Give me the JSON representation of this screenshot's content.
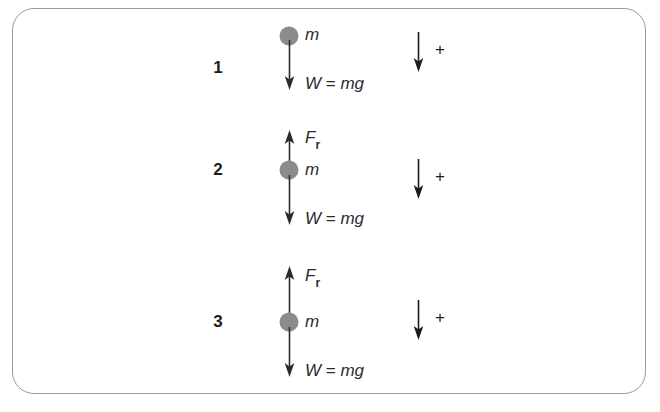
{
  "figure": {
    "type": "physics-free-body-diagram",
    "background_color": "#ffffff",
    "border_color": "#9a9a9a",
    "dot_color": "#8c8c8c",
    "arrow_color": "#2b2b2b",
    "groups": [
      {
        "number": "1",
        "mass_label": "m",
        "weight_label": "W = mg",
        "weight_label_parts": {
          "lhs": "W",
          "eq": " = ",
          "rhs": "mg"
        },
        "has_resistance_force": false,
        "resistance_label": "",
        "resistance_label_parts": {
          "base": "",
          "sub": ""
        },
        "reference_plus_label": "+",
        "reference_arrow_direction": "down"
      },
      {
        "number": "2",
        "mass_label": "m",
        "weight_label": "W = mg",
        "weight_label_parts": {
          "lhs": "W",
          "eq": " = ",
          "rhs": "mg"
        },
        "has_resistance_force": true,
        "resistance_label": "Fr",
        "resistance_label_parts": {
          "base": "F",
          "sub": "r"
        },
        "reference_plus_label": "+",
        "reference_arrow_direction": "down"
      },
      {
        "number": "3",
        "mass_label": "m",
        "weight_label": "W = mg",
        "weight_label_parts": {
          "lhs": "W",
          "eq": " = ",
          "rhs": "mg"
        },
        "has_resistance_force": true,
        "resistance_label": "Fr",
        "resistance_label_parts": {
          "base": "F",
          "sub": "r"
        },
        "reference_plus_label": "+",
        "reference_arrow_direction": "down"
      }
    ]
  }
}
